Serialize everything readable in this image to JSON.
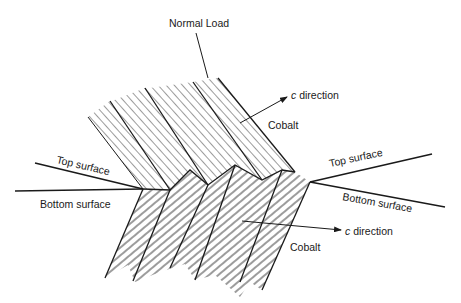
{
  "diagram": {
    "labels": {
      "normal_load": "Normal Load",
      "upper_c_prefix": "c",
      "upper_c_suffix": " direction",
      "upper_material": "Cobalt",
      "top_surface_left": "Top surface",
      "bottom_surface_left": "Bottom surface",
      "top_surface_right": "Top surface",
      "bottom_surface_right": "Bottom surface",
      "lower_c_prefix": "c",
      "lower_c_suffix": " direction",
      "lower_material": "Cobalt"
    },
    "nodes": [
      {
        "id": "upper-grains",
        "label": "Cobalt",
        "description": "Upper (top surface) cobalt grains, hatched, c direction pointing up-right"
      },
      {
        "id": "lower-grains",
        "label": "Cobalt",
        "description": "Lower (bottom surface) cobalt grains, hatched, c direction pointing right"
      },
      {
        "id": "normal-load",
        "label": "Normal Load"
      },
      {
        "id": "top-surface",
        "label": "Top surface"
      },
      {
        "id": "bottom-surface",
        "label": "Bottom surface"
      }
    ],
    "edges": [
      {
        "from": "normal-load",
        "to": "upper-grains",
        "type": "leader-line"
      },
      {
        "from": "upper-grains",
        "to": "c direction",
        "type": "arrow"
      },
      {
        "from": "lower-grains",
        "to": "c direction",
        "type": "arrow"
      }
    ],
    "colors": {
      "ink": "#1a1a1a",
      "background": "#ffffff"
    }
  }
}
